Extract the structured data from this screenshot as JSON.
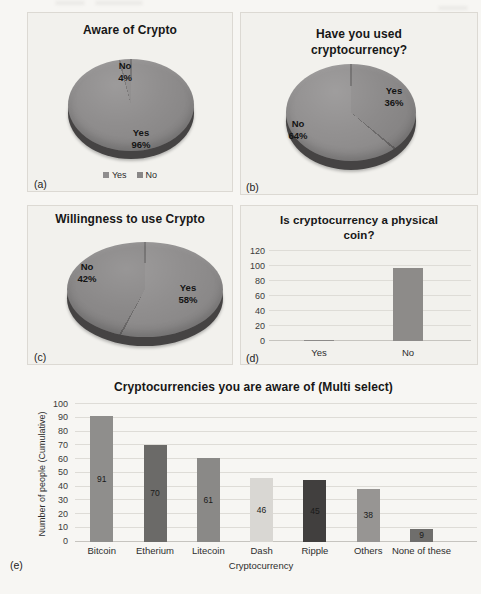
{
  "figure": {
    "panel_labels": [
      "(a)",
      "(b)",
      "(c)",
      "(d)",
      "(e)"
    ]
  },
  "chart_data": [
    {
      "panel": "a",
      "type": "pie",
      "title": "Aware of Crypto",
      "labels": [
        "Yes",
        "No"
      ],
      "values": [
        96,
        4
      ],
      "slices": [
        {
          "label": "Yes",
          "value": 96,
          "value_text": "96%",
          "color": "#8f8d8d"
        },
        {
          "label": "No",
          "value": 4,
          "value_text": "4%",
          "color": "#898787"
        }
      ],
      "seam_color": "#6e6c6c",
      "legend": [
        "Yes",
        "No"
      ],
      "legend_position": "bottom"
    },
    {
      "panel": "b",
      "type": "pie",
      "title": "Have you used cryptocurrency?",
      "labels": [
        "Yes",
        "No"
      ],
      "values": [
        36,
        64
      ],
      "slices": [
        {
          "label": "Yes",
          "value": 36,
          "value_text": "36%",
          "color": "#8c8a8a"
        },
        {
          "label": "No",
          "value": 64,
          "value_text": "64%",
          "color": "#929090"
        }
      ],
      "seam_color": "#6e6c6c"
    },
    {
      "panel": "c",
      "type": "pie",
      "title": "Willingness to use Crypto",
      "labels": [
        "Yes",
        "No"
      ],
      "values": [
        58,
        42
      ],
      "slices": [
        {
          "label": "Yes",
          "value": 58,
          "value_text": "58%",
          "color": "#908e8e"
        },
        {
          "label": "No",
          "value": 42,
          "value_text": "42%",
          "color": "#8a8888"
        }
      ],
      "seam_color": "#6e6c6c"
    },
    {
      "panel": "d",
      "type": "bar",
      "title": "Is cryptocurrency a physical coin?",
      "categories": [
        "Yes",
        "No"
      ],
      "values": [
        2,
        97
      ],
      "ylim": [
        0,
        120
      ],
      "yticks": [
        0,
        20,
        40,
        60,
        80,
        100,
        120
      ],
      "bar_color": "#8d8b89",
      "grid": true
    },
    {
      "panel": "e",
      "type": "bar",
      "title": "Cryptocurrencies you are aware of (Multi select)",
      "categories": [
        "Bitcoin",
        "Etherium",
        "Litecoin",
        "Dash",
        "Ripple",
        "Others",
        "None of these"
      ],
      "values": [
        91,
        70,
        61,
        46,
        45,
        38,
        9
      ],
      "bar_colors": [
        "#8f8e8c",
        "#6b6a68",
        "#8a8987",
        "#d9d7d3",
        "#413f3e",
        "#979593",
        "#6f6e6c"
      ],
      "xlabel": "Cryptocurrency",
      "ylabel": "Number of people (Cumulative)",
      "ylim": [
        0,
        100
      ],
      "yticks": [
        0,
        10,
        20,
        30,
        40,
        50,
        60,
        70,
        80,
        90,
        100
      ],
      "data_labels": true,
      "grid": true
    }
  ]
}
